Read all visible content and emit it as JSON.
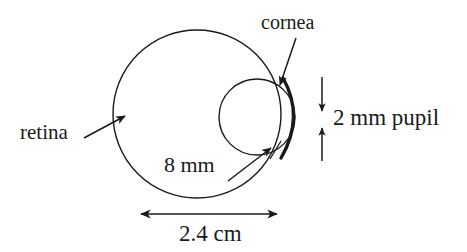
{
  "figure": {
    "type": "diagram",
    "background_color": "#ffffff",
    "stroke_color": "#1a1a1a"
  },
  "labels": {
    "cornea": "cornea",
    "retina": "retina",
    "lens_radius": "8 mm",
    "pupil": "2 mm pupil",
    "eye_diameter": "2.4 cm"
  },
  "geometry": {
    "eyeball": {
      "name": "retina-circle",
      "center_x": 197,
      "center_y": 114,
      "radius": 84,
      "stroke_width": 1.4
    },
    "lens": {
      "name": "lens-circle",
      "center_x": 257,
      "center_y": 117,
      "radius": 38,
      "stroke_width": 1.4
    },
    "cornea_arc": {
      "name": "cornea-arc",
      "start_x": 283,
      "start_y": 78,
      "end_x": 281,
      "end_y": 158,
      "bulge_x": 297,
      "bulge_y": 117,
      "stroke_width": 3.2
    }
  },
  "annotations": {
    "cornea_leader": {
      "from_x": 294,
      "from_y": 40,
      "to_x": 281,
      "to_y": 84
    },
    "retina_leader": {
      "from_x": 86,
      "from_y": 137,
      "to_x": 124,
      "to_y": 116
    },
    "lens_radius_leader": {
      "from_x": 229,
      "from_y": 180,
      "to_x": 272,
      "to_y": 147,
      "tick_x1": 271,
      "tick_y1": 158,
      "tick_x2": 281,
      "tick_y2": 142
    },
    "pupil_gauge": {
      "x": 322,
      "top_y": 77,
      "top_arrow_y": 110,
      "bottom_arrow_y": 128,
      "bottom_y": 161
    },
    "diameter_gauge": {
      "y": 214,
      "left_x": 140,
      "right_x": 278
    }
  }
}
